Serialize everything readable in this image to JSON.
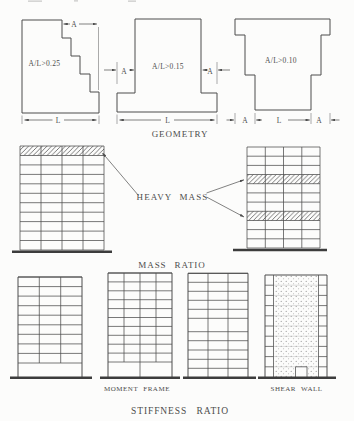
{
  "page": {
    "background": "#fcfcfb",
    "ink_color": "#4c4c4c",
    "ground_color": "#3c3c3c"
  },
  "geometry": {
    "caption": "GEOMETRY",
    "stepped_building": {
      "ratio": "A/L>0.25",
      "dim_a": "A",
      "dim_l": "L"
    },
    "tower_building": {
      "ratio": "A/L>0.15",
      "dim_a_left": "A",
      "dim_a_right": "A",
      "dim_l": "L"
    },
    "flared_building": {
      "ratio": "A/L>0.10",
      "dim_a_left": "A",
      "dim_l": "L",
      "dim_a_right": "A"
    }
  },
  "mass_ratio": {
    "caption": "MASS RATIO",
    "annotation": "HEAVY MASS",
    "left_building": {
      "columns": 4,
      "stories": 11,
      "heavy_mass_stories_from_top": [
        1
      ]
    },
    "right_building": {
      "columns": 4,
      "stories": 11,
      "heavy_mass_stories_from_top": [
        4,
        8
      ]
    }
  },
  "stiffness_ratio": {
    "caption": "STIFFNESS RATIO",
    "moment_frame_label": "MOMENT FRAME",
    "shear_wall_label": "SHEAR WALL",
    "soft_story_building": {
      "columns": 3,
      "stories": 10,
      "open_story": "bottom"
    },
    "moment_frame_building": {
      "columns": 4,
      "stories": 11
    },
    "tall_story_building": {
      "columns": 3,
      "stories": 11,
      "tall_story_from_top": 6
    },
    "shear_wall_building": {
      "stories": 10,
      "wall_position": "center"
    }
  }
}
